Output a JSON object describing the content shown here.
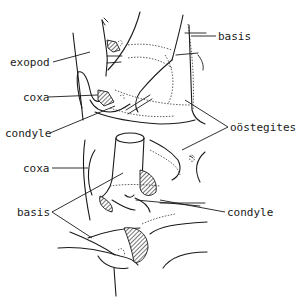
{
  "figure": {
    "type": "anatomical line drawing"
  },
  "labels": {
    "basis_top": "basis",
    "exopod": "exopod",
    "coxa_upper": "coxa",
    "condyle_upper": "condyle",
    "oostegites": "oöstegites",
    "coxa_lower": "coxa",
    "basis_lower": "basis",
    "condyle_lower": "condyle"
  },
  "colors": {
    "ink": "#1a1a1a",
    "background": "#ffffff"
  }
}
